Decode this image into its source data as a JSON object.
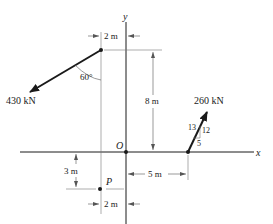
{
  "axes": {
    "x_label": "x",
    "y_label": "y",
    "origin_label": "O"
  },
  "forces": [
    {
      "id": "f1",
      "magnitude_label": "430 kN",
      "angle_label": "60°"
    },
    {
      "id": "f2",
      "magnitude_label": "260 kN",
      "slope": {
        "hyp": "13",
        "rise": "12",
        "run": "5"
      }
    }
  ],
  "point": {
    "label": "P"
  },
  "dimensions": {
    "top_width": "2 m",
    "height": "8 m",
    "right_width": "5 m",
    "p_depth": "3 m",
    "bottom_width": "2 m"
  },
  "colors": {
    "ink": "#1a1a1a",
    "thin": "#555555"
  }
}
